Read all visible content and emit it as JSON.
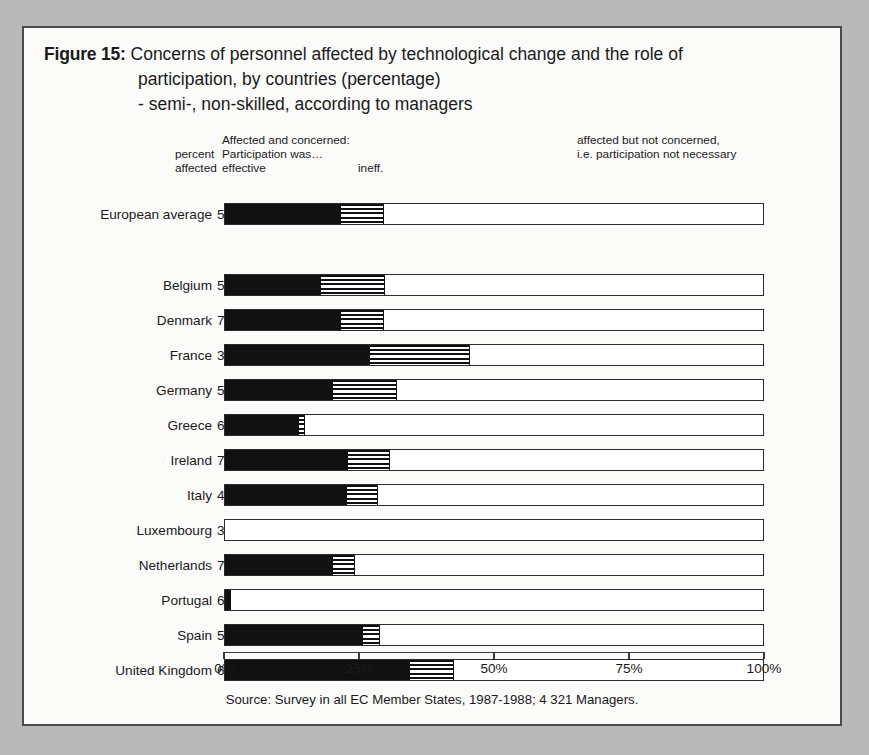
{
  "figure": {
    "label": "Figure 15:",
    "title_line1": "Concerns of personnel affected by technological change and the role of",
    "title_line2": "participation, by countries (percentage)",
    "title_line3": "- semi-, non-skilled, according to managers"
  },
  "headers": {
    "percent_affected_l1": "percent",
    "percent_affected_l2": "affected",
    "affected_concerned": "Affected and concerned:",
    "participation_was": "Participation was…",
    "effective": "effective",
    "ineffective": "ineff.",
    "not_concerned_l1": "affected but not concerned,",
    "not_concerned_l2": "i.e. participation not necessary"
  },
  "source": "Source: Survey in all EC Member States, 1987-1988; 4 321 Managers.",
  "colors": {
    "effective": "#111111",
    "ineffective_hatch": "#111111",
    "not_concerned": "#ffffff",
    "bar_outline": "#2b2b2b",
    "frame": "#4a4a4a",
    "page_background": "#b9b9b9",
    "figure_background": "#fbfbfa"
  },
  "chart_data": {
    "type": "bar",
    "subtype": "stacked-horizontal",
    "title": "Figure 15: Concerns of personnel affected by technological change and the role of participation, by countries (percentage) - semi-, non-skilled, according to managers",
    "xlabel": "",
    "ylabel": "",
    "xlim": [
      0,
      100
    ],
    "xticks": [
      0,
      25,
      50,
      75,
      100
    ],
    "xtick_labels": [
      "0%",
      "25%",
      "50%",
      "75%",
      "100%"
    ],
    "grid": false,
    "legend_position": "top",
    "series": [
      {
        "name": "Affected and concerned: Participation was effective",
        "key": "effective",
        "values": [
          21.5,
          17.8,
          21.5,
          27.0,
          20.0,
          13.7,
          22.8,
          22.6,
          0,
          20.0,
          1.1,
          25.6,
          34.4
        ]
      },
      {
        "name": "Affected and concerned: Participation was ineffective",
        "key": "ineffective",
        "values": [
          8.1,
          11.9,
          8.1,
          18.5,
          11.9,
          1.1,
          7.8,
          5.9,
          0,
          4.1,
          0,
          3.3,
          8.1
        ]
      },
      {
        "name": "Affected but not concerned, i.e. participation not necessary",
        "key": "not_concerned",
        "values": [
          70.4,
          70.3,
          70.4,
          54.5,
          68.1,
          85.2,
          69.4,
          71.5,
          100,
          75.9,
          98.9,
          71.1,
          57.5
        ]
      }
    ],
    "categories": [
      "European average",
      "Belgium",
      "Denmark",
      "France",
      "Germany",
      "Greece",
      "Ireland",
      "Italy",
      "Luxembourg",
      "Netherlands",
      "Portugal",
      "Spain",
      "United Kingdom"
    ],
    "percent_affected": [
      54,
      53,
      70,
      30,
      55,
      66,
      70,
      45,
      36,
      73,
      66,
      53,
      61
    ]
  },
  "rows": [
    {
      "label": "European average",
      "percent_affected": "54",
      "effective": 21.5,
      "ineffective": 8.1,
      "top": 173
    },
    {
      "label": "Belgium",
      "percent_affected": "53",
      "effective": 17.8,
      "ineffective": 11.9,
      "top": 244
    },
    {
      "label": "Denmark",
      "percent_affected": "70",
      "effective": 21.5,
      "ineffective": 8.1,
      "top": 279
    },
    {
      "label": "France",
      "percent_affected": "30",
      "effective": 27.0,
      "ineffective": 18.5,
      "top": 314
    },
    {
      "label": "Germany",
      "percent_affected": "55",
      "effective": 20.0,
      "ineffective": 11.9,
      "top": 349
    },
    {
      "label": "Greece",
      "percent_affected": "66",
      "effective": 13.7,
      "ineffective": 1.1,
      "top": 384
    },
    {
      "label": "Ireland",
      "percent_affected": "70",
      "effective": 22.8,
      "ineffective": 7.8,
      "top": 419
    },
    {
      "label": "Italy",
      "percent_affected": "45",
      "effective": 22.6,
      "ineffective": 5.9,
      "top": 454
    },
    {
      "label": "Luxembourg",
      "percent_affected": "36",
      "effective": 0,
      "ineffective": 0,
      "top": 489
    },
    {
      "label": "Netherlands",
      "percent_affected": "73",
      "effective": 20.0,
      "ineffective": 4.1,
      "top": 524
    },
    {
      "label": "Portugal",
      "percent_affected": "66",
      "effective": 1.1,
      "ineffective": 0,
      "top": 559
    },
    {
      "label": "Spain",
      "percent_affected": "53",
      "effective": 25.6,
      "ineffective": 3.3,
      "top": 594
    },
    {
      "label": "United Kingdom",
      "percent_affected": "61",
      "effective": 34.4,
      "ineffective": 8.1,
      "top": 629
    }
  ],
  "axis": {
    "ticks": [
      {
        "label": "0%",
        "value": 0
      },
      {
        "label": "25%",
        "value": 25
      },
      {
        "label": "50%",
        "value": 50
      },
      {
        "label": "75%",
        "value": 75
      },
      {
        "label": "100%",
        "value": 100
      }
    ]
  }
}
